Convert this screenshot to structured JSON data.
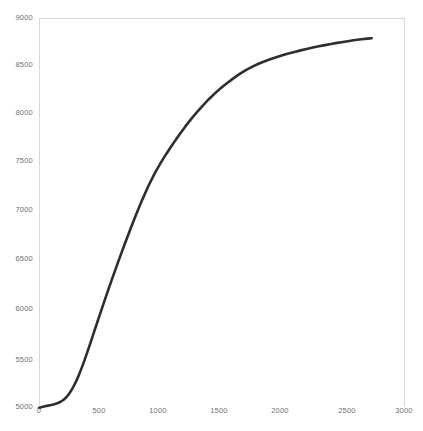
{
  "chart_data": {
    "type": "line",
    "title": "",
    "xlabel": "",
    "ylabel": "",
    "xlim": [
      0,
      3000
    ],
    "ylim": [
      5000,
      9000
    ],
    "grid": false,
    "legend": null,
    "line_color": "#2e2e2e",
    "frame_color": "#d9d9d9",
    "tick_color": "#707070",
    "x_ticks": [
      0,
      500,
      1000,
      1500,
      2000,
      2500,
      3000
    ],
    "x_tick_labels": [
      "0",
      "500",
      "1000",
      "1500",
      "2000",
      "2500",
      "3000"
    ],
    "y_ticks": [
      5000,
      5500,
      6000,
      6500,
      7000,
      7500,
      8000,
      8500,
      9000
    ],
    "y_tick_labels": [
      "5000",
      "5500",
      "6000",
      "6500",
      "7000",
      "7500",
      "8000",
      "8500",
      "9000"
    ],
    "series": [
      {
        "name": "series-1",
        "x": [
          0,
          25,
          50,
          75,
          100,
          125,
          150,
          175,
          200,
          225,
          250,
          275,
          300,
          325,
          350,
          375,
          400,
          425,
          450,
          475,
          500,
          550,
          600,
          650,
          700,
          750,
          800,
          850,
          900,
          950,
          1000,
          1050,
          1100,
          1150,
          1200,
          1250,
          1300,
          1350,
          1400,
          1450,
          1500,
          1550,
          1600,
          1650,
          1700,
          1750,
          1800,
          1850,
          1900,
          1950,
          2000,
          2050,
          2100,
          2150,
          2200,
          2250,
          2300,
          2350,
          2400,
          2450,
          2500,
          2550,
          2600,
          2650,
          2700,
          2735
        ],
        "y": [
          4990,
          5000,
          5008,
          5014,
          5020,
          5028,
          5038,
          5052,
          5072,
          5100,
          5140,
          5190,
          5250,
          5320,
          5400,
          5485,
          5575,
          5668,
          5762,
          5856,
          5950,
          6135,
          6315,
          6490,
          6660,
          6825,
          6985,
          7135,
          7275,
          7400,
          7510,
          7610,
          7705,
          7795,
          7880,
          7960,
          8035,
          8105,
          8170,
          8230,
          8285,
          8335,
          8382,
          8425,
          8463,
          8497,
          8527,
          8553,
          8576,
          8597,
          8616,
          8634,
          8651,
          8667,
          8682,
          8696,
          8709,
          8721,
          8733,
          8744,
          8754,
          8764,
          8773,
          8781,
          8788,
          8792
        ]
      }
    ]
  },
  "axes": {
    "plot_left_px": 39,
    "plot_right_px": 404,
    "plot_top_px": 18,
    "plot_bottom_px": 407
  }
}
